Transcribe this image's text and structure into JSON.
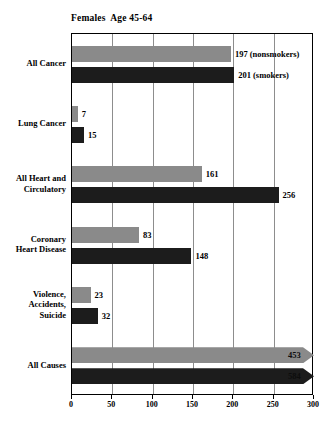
{
  "chart_data": {
    "type": "bar",
    "orientation": "horizontal",
    "title": "Females  Age 45-64",
    "xlabel": "",
    "ylabel": "",
    "xlim": [
      0,
      300
    ],
    "xticks": [
      0,
      50,
      100,
      150,
      200,
      250,
      300
    ],
    "grid": true,
    "legend_position": "inline-annotation",
    "categories": [
      "All Cancer",
      "Lung Cancer",
      "All Heart and\nCirculatory",
      "Coronary\nHeart Disease",
      "Violence,\nAccidents,\nSuicide",
      "All Causes"
    ],
    "series": [
      {
        "name": "nonsmokers",
        "color": "#8a8a8a",
        "values": [
          197,
          7,
          161,
          83,
          23,
          453
        ]
      },
      {
        "name": "smokers",
        "color": "#1c1c1c",
        "values": [
          201,
          15,
          256,
          148,
          32,
          584
        ]
      }
    ],
    "annotations": [
      {
        "text": "197  (nonsmokers)",
        "category": "All Cancer",
        "series": "nonsmokers"
      },
      {
        "text": "201  (smokers)",
        "category": "All Cancer",
        "series": "smokers"
      }
    ],
    "bar_labels": {
      "nonsmokers": [
        "197  (nonsmokers)",
        "7",
        "161",
        "83",
        "23",
        "453"
      ],
      "smokers": [
        "201  (smokers)",
        "15",
        "256",
        "148",
        "32",
        "584"
      ]
    },
    "overflow_categories": [
      "All Causes"
    ],
    "overflow_note": "All Causes bars are drawn as arrows because values exceed the 300 axis maximum"
  },
  "axis": {
    "tick_labels": [
      "0",
      "50",
      "100",
      "150",
      "200",
      "250",
      "300"
    ]
  }
}
